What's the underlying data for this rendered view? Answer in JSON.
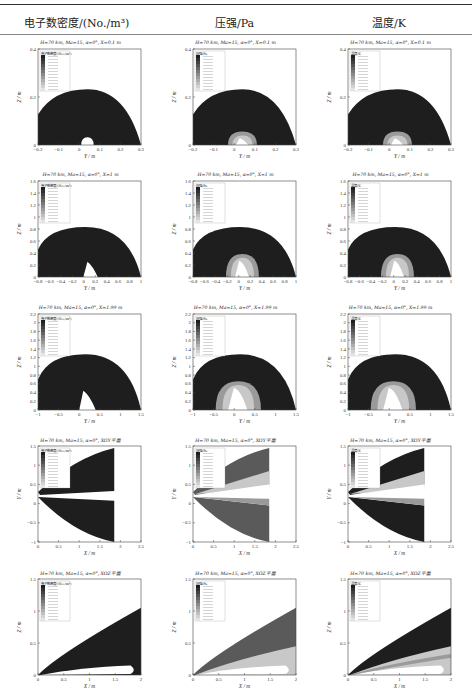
{
  "table": {
    "columns": [
      {
        "label": "电子数密度/(No./m³)"
      },
      {
        "label": "压强/Pa"
      },
      {
        "label": "温度/K"
      }
    ],
    "rows": [
      {
        "section": "X=0.1 m",
        "title": "H=70 km, Ma=15, α=0°, X=0.1 m",
        "xlabel": "Y / m",
        "ylabel": "Z / m",
        "xticks": [
          "−0.2",
          "−0.1",
          "0",
          "0.1",
          "0.2",
          "0.3"
        ],
        "yticks": [
          "0",
          "0.2",
          "0.4"
        ]
      },
      {
        "section": "X=1 m",
        "title": "H=70 km, Ma=15, α=0°, X=1 m",
        "xlabel": "Y / m",
        "ylabel": "Z / m",
        "xticks": [
          "−0.8",
          "−0.6",
          "−0.4",
          "−0.2",
          "0",
          "0.2",
          "0.4",
          "0.6",
          "0.8",
          "1"
        ],
        "yticks": [
          "0",
          "0.2",
          "0.4",
          "0.6",
          "0.8",
          "1",
          "1.2",
          "1.4",
          "1.6"
        ]
      },
      {
        "section": "X=1.99 m",
        "title": "H=70 km, Ma=15, α=0°, X=1.99 m",
        "xlabel": "Y / m",
        "ylabel": "Z / m",
        "xticks": [
          "−1",
          "−0.5",
          "0",
          "0.5",
          "1",
          "1.5"
        ],
        "yticks": [
          "0",
          "0.2",
          "0.4",
          "0.6",
          "0.8",
          "1",
          "1.2",
          "1.4",
          "1.6",
          "1.8",
          "2",
          "2.2"
        ]
      },
      {
        "section": "XOY平面",
        "title": "H=70 km, Ma=15, α=0°, XOY平面",
        "xlabel": "X / m",
        "ylabel": "Y / m",
        "xticks": [
          "0",
          "0.5",
          "1",
          "1.5",
          "2",
          "2.5"
        ],
        "yticks": [
          "−1",
          "−0.5",
          "0",
          "0.5",
          "1",
          "1.5"
        ]
      },
      {
        "section": "XOZ平面",
        "title": "H=70 km, Ma=15, α=0°, XOZ平面",
        "xlabel": "X / m",
        "ylabel": "Z / m",
        "xticks": [
          "0",
          "0.5",
          "1",
          "1.5",
          "2"
        ],
        "yticks": [
          "0",
          "0.5",
          "1",
          "1.5"
        ]
      }
    ],
    "legend_titles": [
      "电子数密度/(No./m³)",
      "压强/Pa",
      "温度/K"
    ]
  },
  "chart_data": {
    "type": "heatmap",
    "conditions": {
      "H": "70 km",
      "Ma": 15,
      "alpha": "0°"
    },
    "grid": {
      "rows": [
        "X=0.1 m",
        "X=1 m",
        "X=1.99 m",
        "XOY平面",
        "XOZ平面"
      ],
      "columns": [
        "电子数密度/(No./m³)",
        "压强/Pa",
        "温度/K"
      ]
    },
    "axis_ranges": [
      {
        "x": [
          -0.27,
          0.32
        ],
        "y": [
          0,
          0.5
        ]
      },
      {
        "x": [
          -0.9,
          1.0
        ],
        "y": [
          0,
          1.7
        ]
      },
      {
        "x": [
          -1.0,
          1.5
        ],
        "y": [
          0,
          2.3
        ]
      },
      {
        "x": [
          -0.1,
          2.9
        ],
        "y": [
          -1.2,
          1.5
        ]
      },
      {
        "x": [
          -0.1,
          2.0
        ],
        "y": [
          0,
          1.9
        ]
      }
    ]
  }
}
